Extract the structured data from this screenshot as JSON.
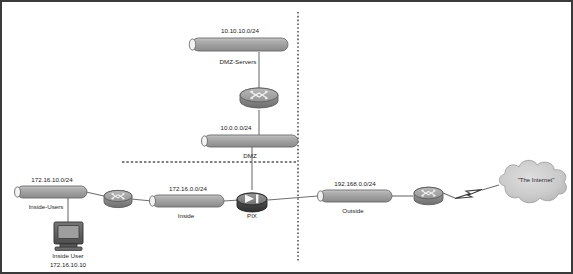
{
  "diagram": {
    "type": "network-topology",
    "background_color": "#ffffff",
    "border_color": "#3a3a3a",
    "link_color": "#707070",
    "divider_color": "#555555"
  },
  "networks": [
    {
      "id": "dmz-servers",
      "subnet": "10.10.10.0/24",
      "name": "DMZ-Servers",
      "zone": "dmz"
    },
    {
      "id": "dmz",
      "subnet": "10.0.0.0/24",
      "name": "DMZ",
      "zone": "dmz"
    },
    {
      "id": "inside-users",
      "subnet": "172.16.10.0/24",
      "name": "Inside-Users",
      "zone": "inside"
    },
    {
      "id": "inside",
      "subnet": "172.16.0.0/24",
      "name": "Inside",
      "zone": "inside"
    },
    {
      "id": "outside",
      "subnet": "192.168.0.0/24",
      "name": "Outside",
      "zone": "outside"
    }
  ],
  "devices": [
    {
      "id": "router-dmz",
      "label": "",
      "icon": "router-icon",
      "type": "router"
    },
    {
      "id": "router-inside",
      "label": "",
      "icon": "router-icon",
      "type": "router"
    },
    {
      "id": "router-outside",
      "label": "",
      "icon": "router-icon",
      "type": "router"
    },
    {
      "id": "pix-firewall",
      "label": "PIX",
      "icon": "firewall-icon",
      "type": "firewall"
    },
    {
      "id": "inside-workstation",
      "label": "Inside User",
      "address": "172.16.10.10",
      "icon": "workstation-icon",
      "type": "workstation"
    },
    {
      "id": "internet-cloud",
      "label": "\"The Internet\"",
      "icon": "cloud-icon",
      "type": "cloud"
    }
  ],
  "labels": {
    "dmz_servers_subnet": "10.10.10.0/24",
    "dmz_servers_name": "DMZ-Servers",
    "dmz_subnet": "10.0.0.0/24",
    "dmz_name": "DMZ",
    "inside_users_subnet": "172.16.10.0/24",
    "inside_users_name": "Inside-Users",
    "inside_subnet": "172.16.0.0/24",
    "inside_name": "Inside",
    "outside_subnet": "192.168.0.0/24",
    "outside_name": "Outside",
    "pix_name": "PIX",
    "workstation_name": "Inside User",
    "workstation_address": "172.16.10.10",
    "internet_name": "\"The Internet\""
  }
}
